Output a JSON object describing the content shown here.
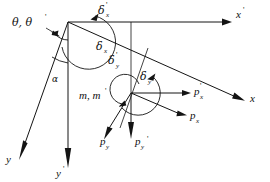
{
  "figure": {
    "type": "vector-mechanics-diagram",
    "background_color": "#ffffff",
    "line_color": "#141414",
    "width": 270,
    "height": 182
  },
  "axes": [
    {
      "id": "x-prime",
      "label": "x",
      "prime": "'",
      "description": "horizontal axis pointing right from origin",
      "from": [
        68,
        22
      ],
      "to": [
        228,
        22
      ]
    },
    {
      "id": "x",
      "label": "x",
      "prime": "",
      "description": "rotated axis sloping down to the right",
      "from": [
        68,
        22
      ],
      "to": [
        243,
        100
      ]
    },
    {
      "id": "y-prime",
      "label": "y",
      "prime": "'",
      "description": "vertical axis pointing down from origin",
      "from": [
        68,
        22
      ],
      "to": [
        68,
        170
      ]
    },
    {
      "id": "y",
      "label": "y",
      "prime": "",
      "description": "rotated axis sloping down to the left",
      "from": [
        68,
        22
      ],
      "to": [
        20,
        152
      ]
    }
  ],
  "angles": [
    {
      "id": "theta",
      "label": "θ, θ",
      "prime": "'",
      "description": "angle between y and y' axes marked at origin"
    },
    {
      "id": "alpha",
      "label": "α",
      "prime": "",
      "description": "angle between y and y' axes lower marker"
    },
    {
      "id": "delta-x-prime",
      "label": "δ",
      "sub": "x",
      "prime": "'",
      "description": "rotation arc about x' at origin"
    },
    {
      "id": "delta-x",
      "label": "δ",
      "sub": "x",
      "prime": "",
      "description": "displacement along rotated x axis"
    },
    {
      "id": "delta-y-prime",
      "label": "δ",
      "sub": "y",
      "prime": "'",
      "description": "displacement along y' direction"
    },
    {
      "id": "delta-y",
      "label": "δ",
      "sub": "y",
      "prime": "",
      "description": "rotation arc at second node"
    }
  ],
  "forces": [
    {
      "id": "p-x-prime",
      "label": "p",
      "sub": "x",
      "prime": "'",
      "description": "horizontal force arrow at node pointing right"
    },
    {
      "id": "p-x",
      "label": "p",
      "sub": "x",
      "prime": "",
      "description": "force arrow along rotated x direction"
    },
    {
      "id": "p-y-prime",
      "label": "p",
      "sub": "y",
      "prime": "'",
      "description": "vertical force arrow at node pointing down"
    },
    {
      "id": "p-y",
      "label": "p",
      "sub": "y",
      "prime": "",
      "description": "force arrow along rotated y direction"
    }
  ],
  "moments": [
    {
      "id": "m-pair",
      "label": "m, m",
      "prime": "'",
      "description": "moment arcs at the second node"
    }
  ],
  "labels": {
    "theta_pair": "θ, θ",
    "theta_prime": "'",
    "alpha": "α",
    "delta": "δ",
    "m_pair": "m, m",
    "m_prime": "'",
    "p": "p",
    "x": "x",
    "y": "y",
    "sub_x": "x",
    "sub_y": "y",
    "prime": "'"
  }
}
